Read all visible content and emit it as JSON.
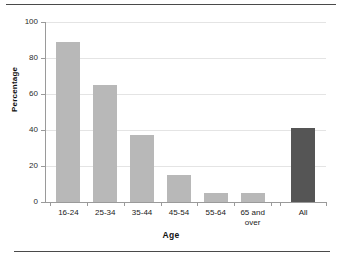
{
  "figure": {
    "top_rule": "horizontal-rule",
    "bottom_rule": "horizontal-rule"
  },
  "chart_data": {
    "type": "bar",
    "title": "",
    "xlabel": "Age",
    "ylabel": "Percentage",
    "categories": [
      "16-24",
      "25-34",
      "35-44",
      "45-54",
      "55-64",
      "65 and\nover",
      "All"
    ],
    "values": [
      89,
      65,
      37,
      15,
      5,
      5,
      41
    ],
    "ylim": [
      0,
      100
    ],
    "yticks": [
      0,
      20,
      40,
      60,
      80,
      100
    ],
    "ytick_labels": [
      "0",
      "20",
      "40",
      "60",
      "80",
      "100"
    ],
    "grid": true,
    "legend": "none",
    "bar_colors": [
      "#b8b8b8",
      "#b8b8b8",
      "#b8b8b8",
      "#b8b8b8",
      "#b8b8b8",
      "#b8b8b8",
      "#555555"
    ],
    "colors": {
      "bar_light": "#b8b8b8",
      "bar_dark": "#555555",
      "gridline": "#e4e4e4",
      "axis": "#9a9a9a",
      "text": "#1a1a1a",
      "rule": "#4a4a4a"
    }
  }
}
